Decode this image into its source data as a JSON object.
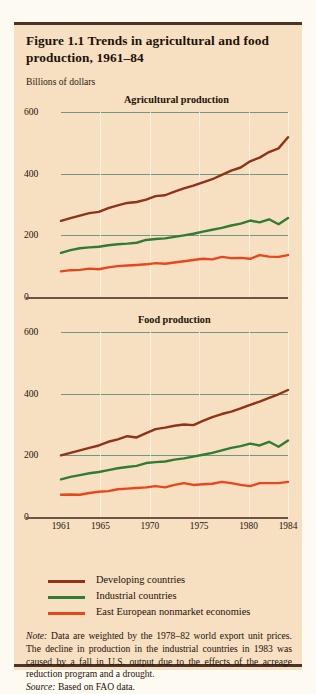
{
  "figure": {
    "title": "Figure 1.1  Trends in agricultural and food production, 1961–84",
    "axis_unit": "Billions of dollars"
  },
  "legend": {
    "items": [
      {
        "label": "Developing countries",
        "color": "#8f3418"
      },
      {
        "label": "Industrial countries",
        "color": "#2e7d32"
      },
      {
        "label": "East European nonmarket economies",
        "color": "#e8471c"
      }
    ]
  },
  "note": {
    "note_prefix": "Note:",
    "note_text": " Data are weighted by the 1978–82 world export unit prices. The decline in production in the industrial countries in 1983 was caused by a fall in U.S. output due to the effects of the acreage reduction program and a drought.",
    "source_prefix": "Source:",
    "source_text": " Based on FAO data."
  },
  "chart_data": [
    {
      "type": "line",
      "title": "Agricultural production",
      "xlabel": "",
      "ylabel": "Billions of dollars",
      "xlim": [
        1961,
        1984
      ],
      "ylim": [
        0,
        600
      ],
      "yticks": [
        0,
        200,
        400,
        600
      ],
      "xticks": [
        1961,
        1965,
        1970,
        1975,
        1980,
        1984
      ],
      "grid": true,
      "legend_position": "below",
      "x": [
        1961,
        1962,
        1963,
        1964,
        1965,
        1966,
        1967,
        1968,
        1969,
        1970,
        1971,
        1972,
        1973,
        1974,
        1975,
        1976,
        1977,
        1978,
        1979,
        1980,
        1981,
        1982,
        1983,
        1984
      ],
      "series": [
        {
          "name": "Developing countries",
          "color": "#8f3418",
          "values": [
            247,
            256,
            264,
            272,
            276,
            288,
            297,
            305,
            308,
            316,
            327,
            330,
            342,
            352,
            361,
            372,
            382,
            396,
            410,
            420,
            440,
            452,
            470,
            482,
            518
          ]
        },
        {
          "name": "Industrial countries",
          "color": "#2e7d32",
          "values": [
            143,
            152,
            158,
            161,
            163,
            168,
            171,
            173,
            176,
            185,
            188,
            190,
            195,
            200,
            205,
            212,
            218,
            224,
            232,
            238,
            248,
            242,
            252,
            236,
            256
          ]
        },
        {
          "name": "East European nonmarket economies",
          "color": "#e8471c",
          "values": [
            83,
            87,
            88,
            92,
            90,
            96,
            100,
            102,
            104,
            106,
            110,
            108,
            112,
            116,
            120,
            124,
            122,
            130,
            126,
            127,
            124,
            136,
            131,
            130,
            136
          ]
        }
      ]
    },
    {
      "type": "line",
      "title": "Food production",
      "xlabel": "",
      "ylabel": "Billions of dollars",
      "xlim": [
        1961,
        1984
      ],
      "ylim": [
        0,
        600
      ],
      "yticks": [
        0,
        200,
        400,
        600
      ],
      "xticks": [
        1961,
        1965,
        1970,
        1975,
        1980,
        1984
      ],
      "grid": true,
      "legend_position": "below",
      "x": [
        1961,
        1962,
        1963,
        1964,
        1965,
        1966,
        1967,
        1968,
        1969,
        1970,
        1971,
        1972,
        1973,
        1974,
        1975,
        1976,
        1977,
        1978,
        1979,
        1980,
        1981,
        1982,
        1983,
        1984
      ],
      "series": [
        {
          "name": "Developing countries",
          "color": "#8f3418",
          "values": [
            200,
            208,
            216,
            224,
            232,
            244,
            252,
            262,
            258,
            272,
            285,
            290,
            296,
            300,
            298,
            312,
            324,
            334,
            342,
            352,
            364,
            374,
            386,
            398,
            412
          ]
        },
        {
          "name": "Industrial countries",
          "color": "#2e7d32",
          "values": [
            122,
            130,
            136,
            142,
            146,
            152,
            158,
            162,
            166,
            175,
            178,
            180,
            186,
            190,
            196,
            202,
            208,
            216,
            224,
            230,
            238,
            232,
            244,
            228,
            248
          ]
        },
        {
          "name": "East European nonmarket economies",
          "color": "#e8471c",
          "values": [
            72,
            73,
            72,
            78,
            82,
            84,
            90,
            92,
            94,
            96,
            100,
            96,
            104,
            110,
            104,
            106,
            108,
            114,
            110,
            104,
            100,
            110,
            110,
            110,
            114
          ]
        }
      ]
    }
  ]
}
